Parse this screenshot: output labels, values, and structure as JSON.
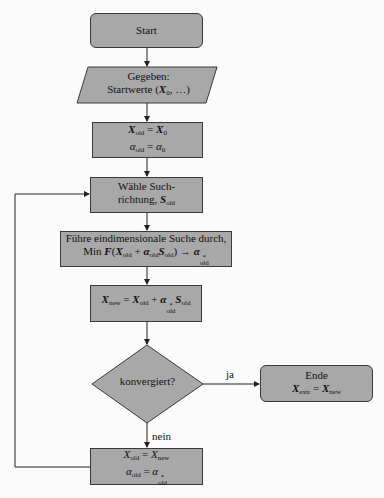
{
  "diagram": {
    "type": "flowchart",
    "colors": {
      "node_fill": "#a8a8a8",
      "stroke": "#222222",
      "background": "#fbfbfb"
    },
    "nodes": {
      "start": {
        "shape": "rounded-rect",
        "label": "Start"
      },
      "given": {
        "shape": "parallelogram",
        "line1": "Gegeben:",
        "line2_prefix": "Startwerte (",
        "line2_var": "X",
        "line2_sub": "0",
        "line2_suffix": ", …)"
      },
      "init": {
        "shape": "rect",
        "line1": {
          "lhs": "X",
          "lhs_sub": "old",
          "eq": " = ",
          "rhs": "X",
          "rhs_sub": "0"
        },
        "line2": {
          "lhs": "α",
          "lhs_sub": "old",
          "eq": " = ",
          "rhs": "α",
          "rhs_sub": "0"
        }
      },
      "choose_dir": {
        "shape": "rect",
        "line1": "Wähle Such-",
        "line2_prefix": "richtung, ",
        "line2_var": "S",
        "line2_sub": "old"
      },
      "line_search": {
        "shape": "rect",
        "line1": "Führe eindimensionale Suche durch,",
        "line2": {
          "min": "Min ",
          "F": "F",
          "open": "(",
          "X": "X",
          "X_sub": "old",
          "plus": " + ",
          "a": "α",
          "a_sub": "old",
          "S": "S",
          "S_sub": "old",
          "close": ") → ",
          "astar": "α",
          "astar_sup": "*",
          "astar_sub": "old"
        }
      },
      "update": {
        "shape": "rect",
        "eq": {
          "lhs": "X",
          "lhs_sub": "new",
          "eq": " = ",
          "x": "X",
          "x_sub": "old",
          "plus": " + ",
          "a": "α",
          "a_sup": "*",
          "a_sub": "old",
          "s": "S",
          "s_sub": "old"
        }
      },
      "converged": {
        "shape": "diamond",
        "label": "konvergiert?"
      },
      "end": {
        "shape": "rounded-rect",
        "line1": "Ende",
        "line2": {
          "lhs": "X",
          "lhs_sub": "extr",
          "eq": " = ",
          "rhs": "X",
          "rhs_sub": "new"
        }
      },
      "reset": {
        "shape": "rect",
        "line1": {
          "lhs": "X",
          "lhs_sub": "old",
          "eq": " = ",
          "rhs": "X",
          "rhs_sub": "new"
        },
        "line2": {
          "lhs": "α",
          "lhs_sub": "old",
          "eq": " = ",
          "rhs": "α",
          "rhs_sup": "*",
          "rhs_sub": "old"
        }
      }
    },
    "edge_labels": {
      "yes": "ja",
      "no": "nein"
    },
    "edges": [
      [
        "start",
        "given"
      ],
      [
        "given",
        "init"
      ],
      [
        "init",
        "choose_dir"
      ],
      [
        "choose_dir",
        "line_search"
      ],
      [
        "line_search",
        "update"
      ],
      [
        "update",
        "converged"
      ],
      [
        "converged",
        "end",
        "ja"
      ],
      [
        "converged",
        "reset",
        "nein"
      ],
      [
        "reset",
        "choose_dir"
      ]
    ]
  }
}
